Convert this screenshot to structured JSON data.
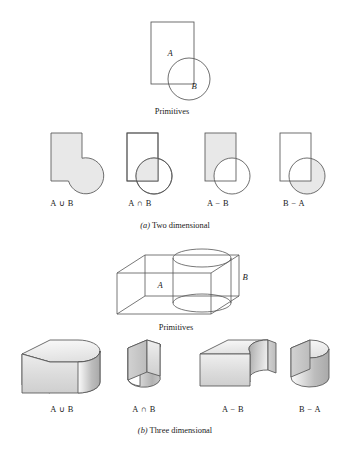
{
  "figure": {
    "title_2d_primitives": "Primitives",
    "title_3d_primitives": "Primitives",
    "caption_a_enum": "(a)",
    "caption_a_text": " Two dimensional",
    "caption_b_enum": "(b)",
    "caption_b_text": " Three dimensional",
    "colors": {
      "shade_fill": "#e8e8e8",
      "stroke": "#555555",
      "background": "#ffffff",
      "text": "#1a1a1a",
      "face_light": "#f2f2f2",
      "face_mid": "#d9d9d9",
      "face_dark": "#b5b5b5"
    }
  },
  "primitives_2d": {
    "label_rect": "A",
    "label_circle": "B",
    "caption": "Primitives"
  },
  "primitives_3d": {
    "label_box": "A",
    "label_cylinder": "B",
    "caption": "Primitives"
  },
  "operations_2d": [
    {
      "id": "union",
      "a": "A",
      "op": "∪",
      "b": "B",
      "label": "A ∪ B"
    },
    {
      "id": "intersection",
      "a": "A",
      "op": "∩",
      "b": "B",
      "label": "A ∩ B"
    },
    {
      "id": "a-minus-b",
      "a": "A",
      "op": "−",
      "b": "B",
      "label": "A − B"
    },
    {
      "id": "b-minus-a",
      "a": "B",
      "op": "−",
      "b": "A",
      "label": "B − A"
    }
  ],
  "operations_3d": [
    {
      "id": "union",
      "a": "A",
      "op": "∪",
      "b": "B",
      "label": "A ∪ B"
    },
    {
      "id": "intersection",
      "a": "A",
      "op": "∩",
      "b": "B",
      "label": "A ∩ B"
    },
    {
      "id": "a-minus-b",
      "a": "A",
      "op": "−",
      "b": "B",
      "label": "A − B"
    },
    {
      "id": "b-minus-a",
      "a": "B",
      "op": "−",
      "b": "A",
      "label": "B − A"
    }
  ]
}
